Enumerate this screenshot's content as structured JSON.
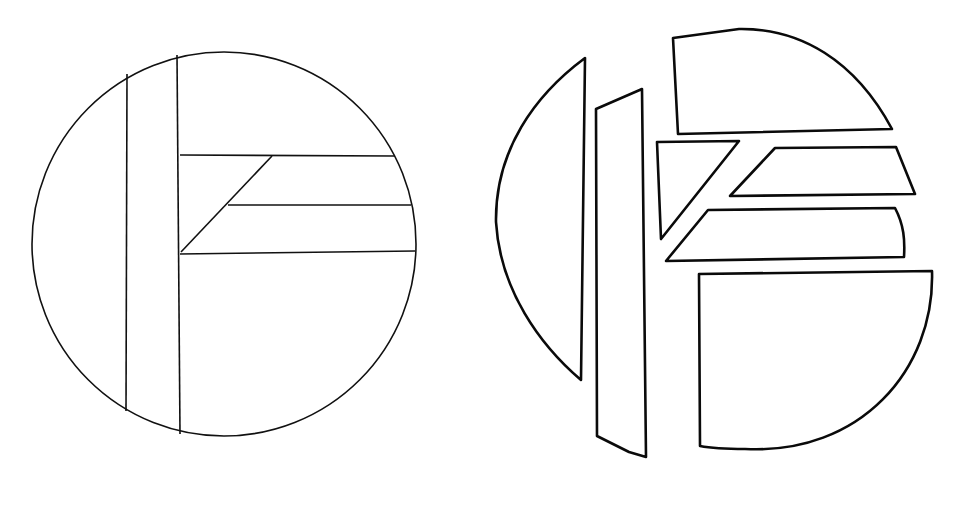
{
  "figure": {
    "colors": {
      "stroke": "#111111",
      "background": "#ffffff"
    },
    "assembled_circle": {
      "center": [
        224,
        244
      ],
      "radius": 191,
      "piece_count": 7
    },
    "exploded_pieces": [
      {
        "name": "left-segment"
      },
      {
        "name": "vertical-strip"
      },
      {
        "name": "top-cap"
      },
      {
        "name": "triangle"
      },
      {
        "name": "upper-bar"
      },
      {
        "name": "lower-bar"
      },
      {
        "name": "bottom-quadrant"
      }
    ]
  }
}
